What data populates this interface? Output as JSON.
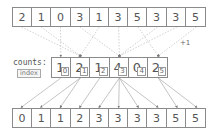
{
  "input_array": [
    2,
    1,
    0,
    3,
    1,
    3,
    5,
    3,
    3,
    5
  ],
  "counts": {
    "label": "counts:",
    "index_label": "index",
    "values": [
      1,
      2,
      1,
      4,
      0,
      2
    ],
    "indices": [
      "0",
      "1",
      "2",
      "3",
      "4",
      "5"
    ]
  },
  "increment_label": "+1",
  "output_array": [
    0,
    1,
    1,
    2,
    3,
    3,
    3,
    3,
    5,
    5
  ],
  "colors": {
    "border": "#8a8a8a",
    "text": "#555555",
    "arrows": "#aaaaaa"
  }
}
